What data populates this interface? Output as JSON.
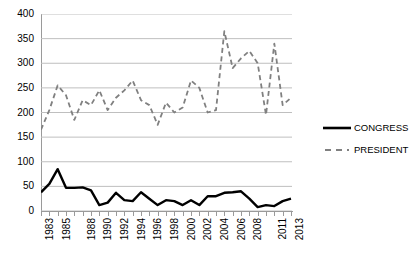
{
  "chart_data": {
    "type": "line",
    "title": "",
    "subtitle": "",
    "xlabel": "",
    "ylabel": "",
    "ylim": [
      0,
      400
    ],
    "ytick_step": 50,
    "ytick_labels": [
      "0",
      "50",
      "100",
      "150",
      "200",
      "250",
      "300",
      "350",
      "400"
    ],
    "grid": true,
    "grid_axis": "y",
    "legend_position": "right",
    "x": [
      1983,
      1984,
      1985,
      1986,
      1987,
      1988,
      1989,
      1990,
      1991,
      1992,
      1993,
      1994,
      1995,
      1996,
      1997,
      1998,
      1999,
      2000,
      2001,
      2002,
      2003,
      2004,
      2005,
      2006,
      2007,
      2008,
      2009,
      2010,
      2011,
      2012,
      2013
    ],
    "xtick_labels_shown": [
      "1983",
      "1985",
      "1988",
      "1990",
      "1992",
      "1994",
      "1996",
      "1998",
      "2000",
      "2002",
      "2004",
      "2006",
      "2008",
      "2011",
      "2013"
    ],
    "xtick_labels_shown_index": [
      0,
      2,
      5,
      7,
      9,
      11,
      13,
      15,
      17,
      19,
      21,
      23,
      25,
      28,
      30
    ],
    "series": [
      {
        "name": "CONGRESS",
        "style": "solid",
        "color": "#000000",
        "width": 2.4,
        "values": [
          38,
          55,
          85,
          47,
          47,
          48,
          42,
          12,
          17,
          37,
          22,
          20,
          38,
          25,
          12,
          22,
          20,
          12,
          22,
          12,
          30,
          30,
          37,
          38,
          40,
          25,
          8,
          12,
          10,
          20,
          25
        ]
      },
      {
        "name": "PRESIDENT",
        "style": "dashed",
        "color": "#808080",
        "width": 1.8,
        "values": [
          165,
          205,
          255,
          235,
          185,
          225,
          215,
          245,
          205,
          230,
          245,
          265,
          225,
          215,
          175,
          220,
          200,
          210,
          265,
          250,
          200,
          205,
          365,
          290,
          310,
          325,
          300,
          195,
          340,
          215,
          230
        ]
      }
    ]
  },
  "legend": {
    "items": [
      {
        "label": "CONGRESS",
        "icon": "solid-line-swatch"
      },
      {
        "label": "PRESIDENT",
        "icon": "dashed-line-swatch"
      }
    ]
  },
  "colors": {
    "congress": "#000000",
    "president": "#808080",
    "grid": "#bfbfbf",
    "axis": "#9a9a9a",
    "background": "#ffffff"
  }
}
